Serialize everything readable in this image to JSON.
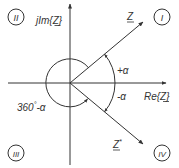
{
  "diagram": {
    "axes": {
      "real_label": "Re{Z}",
      "imag_label": "jIm{Z}"
    },
    "vectors": {
      "z_label": "Z",
      "z_conj_label": "Z*",
      "z_conj_base": "Z",
      "z_conj_sup": "*"
    },
    "angles": {
      "plus_alpha": "+α",
      "minus_alpha": "-α",
      "full_minus_alpha_prefix": "360",
      "full_minus_alpha_suffix": "-α",
      "degree_mark": "°"
    },
    "quadrants": [
      {
        "id": "I",
        "label": "I"
      },
      {
        "id": "II",
        "label": "II"
      },
      {
        "id": "III",
        "label": "III"
      },
      {
        "id": "IV",
        "label": "IV"
      }
    ],
    "colors": {
      "stroke": "#333333",
      "background": "#ffffff"
    }
  }
}
